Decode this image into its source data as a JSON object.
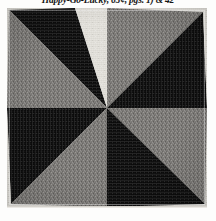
{
  "caption": {
    "text": "Happy-Go-Lucky, 65¢, pgs. 1) & 42"
  },
  "plate": {
    "label": "quilt-block-photograph",
    "pattern_name": "Dutchman's Puzzle pinwheel quilt block",
    "ground_color": "#e3e1db",
    "dark_fabric_color": "#0d0d0d",
    "medium_fabric_color": "#7d7b78",
    "light_fabric_color": "#e8e6e0",
    "quadrants": [
      {
        "position": "top-left",
        "dark_triangle": "upper-right wedge, horizontal fine-stripe print",
        "medium_triangle": "lower-left wedge, speckled gray print"
      },
      {
        "position": "top-right",
        "dark_triangle": "lower-right wedge, vertical fine-stripe print",
        "medium_triangle": "upper-left wedge, speckled gray print"
      },
      {
        "position": "bottom-left",
        "dark_triangle": "upper-left wedge, vertical fine-stripe print",
        "medium_triangle": "lower-right wedge, speckled gray print"
      },
      {
        "position": "bottom-right",
        "dark_triangle": "lower-left wedge, horizontal fine-stripe print",
        "medium_triangle": "upper-right wedge, speckled gray print"
      }
    ]
  }
}
